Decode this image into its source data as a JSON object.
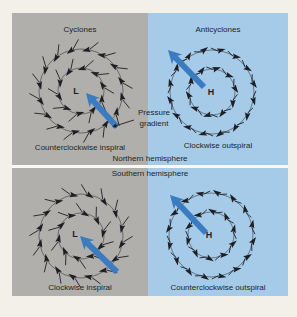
{
  "colors": {
    "page_bg": "#f3f0ea",
    "gray_panel": "#b1afab",
    "blue_panel": "#a6cbe8",
    "arrow_blue": "#3b7cc0",
    "ink": "#1e1f24",
    "divider": "#faf9f5"
  },
  "figure": {
    "titles": {
      "cyclones": "Cyclones",
      "anticyclones": "Anticyclones"
    },
    "hemisphere_labels": {
      "northern": "Northern hemisphere",
      "southern": "Southern hemisphere"
    },
    "annotation": {
      "pressure_gradient": "Pressure gradient"
    },
    "panels": [
      {
        "name": "nh-cyclone",
        "center_label": "L",
        "caption": "Counterclockwise inspiral"
      },
      {
        "name": "nh-anticyclone",
        "center_label": "H",
        "caption": "Clockwise outspiral"
      },
      {
        "name": "sh-cyclone",
        "center_label": "L",
        "caption": "Clockwise inspiral"
      },
      {
        "name": "sh-anticyclone",
        "center_label": "H",
        "caption": "Counterclockwise outspiral"
      }
    ],
    "geometry": {
      "rings": [
        {
          "r": 42,
          "count": 16,
          "phase": 10
        },
        {
          "r": 23,
          "count": 10,
          "phase": 25
        }
      ],
      "vortices": [
        {
          "panel": 0,
          "cx": 81,
          "cy": 91,
          "rotation": "ccw",
          "spiral": "in",
          "label_x": 76,
          "label_y": 94,
          "blue_arrow": {
            "x1": 117,
            "y1": 127,
            "x2": 86,
            "y2": 93
          }
        },
        {
          "panel": 1,
          "cx": 212,
          "cy": 92,
          "rotation": "cw",
          "spiral": "out",
          "label_x": 211,
          "label_y": 95,
          "blue_arrow": {
            "x1": 204,
            "y1": 87,
            "x2": 168,
            "y2": 50
          }
        },
        {
          "panel": 2,
          "cx": 81,
          "cy": 236,
          "rotation": "cw",
          "spiral": "in",
          "label_x": 75,
          "label_y": 237,
          "blue_arrow": {
            "x1": 117,
            "y1": 272,
            "x2": 80,
            "y2": 236
          }
        },
        {
          "panel": 3,
          "cx": 211,
          "cy": 235,
          "rotation": "ccw",
          "spiral": "out",
          "label_x": 209,
          "label_y": 238,
          "blue_arrow": {
            "x1": 206,
            "y1": 233,
            "x2": 170,
            "y2": 195
          }
        }
      ],
      "pointer": {
        "x1": 134,
        "y1": 120,
        "x2": 112,
        "y2": 127
      }
    }
  }
}
